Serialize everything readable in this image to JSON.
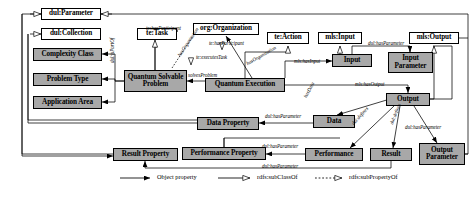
{
  "figure": {
    "type": "ontology-class-diagram"
  },
  "nodes": [
    {
      "id": "dul_parameter",
      "label": "dul:Parameter",
      "kind": "external",
      "x": 41,
      "y": 8,
      "w": 60,
      "h": 12
    },
    {
      "id": "dul_collection",
      "label": "dul:Collection",
      "kind": "external",
      "x": 41,
      "y": 28,
      "w": 60,
      "h": 12
    },
    {
      "id": "te_task",
      "label": "te:Task",
      "kind": "external",
      "x": 137,
      "y": 28,
      "w": 40,
      "h": 12
    },
    {
      "id": "org_organization",
      "label": "org:Organization",
      "kind": "external",
      "x": 193,
      "y": 23,
      "w": 66,
      "h": 12
    },
    {
      "id": "te_action",
      "label": "te:Action",
      "kind": "external",
      "x": 267,
      "y": 32,
      "w": 42,
      "h": 12
    },
    {
      "id": "mls_input",
      "label": "mls:Input",
      "kind": "external",
      "x": 318,
      "y": 32,
      "w": 44,
      "h": 12
    },
    {
      "id": "mls_output",
      "label": "mls:Output",
      "kind": "external",
      "x": 409,
      "y": 32,
      "w": 50,
      "h": 12
    },
    {
      "id": "complexity_class",
      "label": "Complexity Class",
      "kind": "core",
      "x": 33,
      "y": 48,
      "w": 69,
      "h": 13
    },
    {
      "id": "problem_type",
      "label": "Problem Type",
      "kind": "core",
      "x": 33,
      "y": 73,
      "w": 69,
      "h": 13
    },
    {
      "id": "application_area",
      "label": "Application Area",
      "kind": "core",
      "x": 33,
      "y": 96,
      "w": 69,
      "h": 13
    },
    {
      "id": "quantum_solvable_problem",
      "label": "Quantum Solvable Problem",
      "kind": "core",
      "x": 124,
      "y": 70,
      "w": 63,
      "h": 22
    },
    {
      "id": "quantum_execution",
      "label": "Quantum Execution",
      "kind": "core",
      "x": 205,
      "y": 78,
      "w": 80,
      "h": 14
    },
    {
      "id": "input",
      "label": "Input",
      "kind": "core",
      "x": 332,
      "y": 54,
      "w": 40,
      "h": 13
    },
    {
      "id": "input_parameter",
      "label": "Input Parameter",
      "kind": "core",
      "x": 388,
      "y": 52,
      "w": 45,
      "h": 21
    },
    {
      "id": "data_property",
      "label": "Data Property",
      "kind": "core",
      "x": 197,
      "y": 117,
      "w": 62,
      "h": 13
    },
    {
      "id": "data",
      "label": "Data",
      "kind": "core",
      "x": 313,
      "y": 115,
      "w": 42,
      "h": 13
    },
    {
      "id": "output",
      "label": "Output",
      "kind": "core",
      "x": 386,
      "y": 93,
      "w": 44,
      "h": 13
    },
    {
      "id": "result_property",
      "label": "Result Property",
      "kind": "core",
      "x": 113,
      "y": 148,
      "w": 65,
      "h": 13
    },
    {
      "id": "performance_property",
      "label": "Performance Property",
      "kind": "core",
      "x": 182,
      "y": 147,
      "w": 84,
      "h": 13
    },
    {
      "id": "performance",
      "label": "Performance",
      "kind": "core",
      "x": 305,
      "y": 148,
      "w": 58,
      "h": 13
    },
    {
      "id": "result",
      "label": "Result",
      "kind": "core",
      "x": 370,
      "y": 148,
      "w": 42,
      "h": 13
    },
    {
      "id": "output_parameter",
      "label": "Output Parameter",
      "kind": "core",
      "x": 419,
      "y": 143,
      "w": 46,
      "h": 22
    }
  ],
  "edge_labels": [
    {
      "id": "te_hasparticipant_1",
      "text": "te:hasParticipant",
      "x": 146,
      "y": 25,
      "rot": 0
    },
    {
      "id": "te_hasparticipant_2",
      "text": "te:hasParticipant",
      "x": 209,
      "y": 40,
      "rot": 0
    },
    {
      "id": "hasorganization",
      "text": "hasOrganization",
      "x": 176,
      "y": 54,
      "rot": -56
    },
    {
      "id": "te_executestask",
      "text": "te:executesTask",
      "x": 196,
      "y": 54,
      "rot": 0
    },
    {
      "id": "hasorganization_2",
      "text": "hasOrganization",
      "x": 245,
      "y": 61,
      "rot": -30
    },
    {
      "id": "solvesproblem",
      "text": "solvesProblem",
      "x": 188,
      "y": 72,
      "rot": 0
    },
    {
      "id": "dul_ispartof",
      "text": "dul:isPartOf",
      "x": 109,
      "y": 63,
      "rot": -90
    },
    {
      "id": "mls_hasinput",
      "text": "mls:hasInput",
      "x": 294,
      "y": 58,
      "rot": 0
    },
    {
      "id": "dul_hasparameter_input",
      "text": "dul:hasParameter",
      "x": 368,
      "y": 40,
      "rot": 0
    },
    {
      "id": "mls_hasoutput",
      "text": "mls:hasOutput",
      "x": 355,
      "y": 81,
      "rot": 0
    },
    {
      "id": "dul_hasparameter_data",
      "text": "dul:hasParameter",
      "x": 265,
      "y": 113,
      "rot": 0
    },
    {
      "id": "dul_hasdata",
      "text": "hasData",
      "x": 302,
      "y": 96,
      "rot": -62
    },
    {
      "id": "dul_defines_perf",
      "text": "dul:defines",
      "x": 350,
      "y": 122,
      "rot": -48
    },
    {
      "id": "dul_defines_result",
      "text": "dul:defines",
      "x": 388,
      "y": 123,
      "rot": -68
    },
    {
      "id": "dul_hasparameter_out",
      "text": "dul:hasParameter",
      "x": 405,
      "y": 124,
      "rot": 0
    },
    {
      "id": "dul_hasparameter_perf",
      "text": "dul:hasParameter",
      "x": 262,
      "y": 143,
      "rot": 0
    },
    {
      "id": "dul_hasparameter_res",
      "text": "dul:hasParameter",
      "x": 262,
      "y": 163,
      "rot": 0
    }
  ],
  "legend": {
    "items": [
      {
        "id": "object-property",
        "label": "Object property",
        "style": "solid-filled-arrow"
      },
      {
        "id": "rdfs-subclassof",
        "label": "rdfs:subClassOf",
        "style": "solid-hollow-arrow"
      },
      {
        "id": "rdfs-subpropertyof",
        "label": "rdfs:subPropertyOf",
        "style": "dashed-hollow-arrow"
      }
    ]
  },
  "colors": {
    "core_fill": "#a8a8a8",
    "external_fill": "#ffffff",
    "stroke": "#000000",
    "background": "#ffffff"
  }
}
